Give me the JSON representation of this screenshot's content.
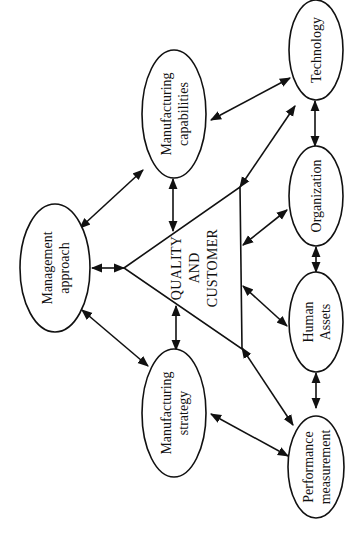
{
  "diagram": {
    "orientation": "rotated-90-ccw",
    "stroke_color": "#111111",
    "background_color": "#ffffff",
    "center": {
      "id": "quality-customer",
      "shape": "triangle",
      "lines": [
        "QUALITY",
        "AND",
        "CUSTOMER"
      ]
    },
    "nodes": [
      {
        "id": "management-approach",
        "lines": [
          "Management",
          "approach"
        ]
      },
      {
        "id": "manufacturing-capabilities",
        "lines": [
          "Manufacturing",
          "capabilities"
        ]
      },
      {
        "id": "manufacturing-strategy",
        "lines": [
          "Manufacturing",
          "strategy"
        ]
      },
      {
        "id": "technology",
        "lines": [
          "Technology"
        ]
      },
      {
        "id": "organization",
        "lines": [
          "Organization"
        ]
      },
      {
        "id": "human-assets",
        "lines": [
          "Human",
          "Assets"
        ]
      },
      {
        "id": "performance-measurement",
        "lines": [
          "Performance",
          "measurement"
        ]
      }
    ],
    "edges": [
      {
        "from": "management-approach",
        "to": "manufacturing-capabilities",
        "type": "bidirectional"
      },
      {
        "from": "management-approach",
        "to": "quality-customer",
        "type": "bidirectional"
      },
      {
        "from": "management-approach",
        "to": "manufacturing-strategy",
        "type": "bidirectional"
      },
      {
        "from": "manufacturing-capabilities",
        "to": "quality-customer",
        "type": "bidirectional"
      },
      {
        "from": "manufacturing-strategy",
        "to": "quality-customer",
        "type": "bidirectional"
      },
      {
        "from": "manufacturing-capabilities",
        "to": "technology",
        "type": "bidirectional"
      },
      {
        "from": "manufacturing-strategy",
        "to": "performance-measurement",
        "type": "bidirectional"
      },
      {
        "from": "quality-customer",
        "to": "technology",
        "type": "bidirectional"
      },
      {
        "from": "quality-customer",
        "to": "organization",
        "type": "bidirectional"
      },
      {
        "from": "quality-customer",
        "to": "human-assets",
        "type": "bidirectional"
      },
      {
        "from": "quality-customer",
        "to": "performance-measurement",
        "type": "bidirectional"
      },
      {
        "from": "technology",
        "to": "organization",
        "type": "bidirectional"
      },
      {
        "from": "organization",
        "to": "human-assets",
        "type": "bidirectional"
      },
      {
        "from": "human-assets",
        "to": "performance-measurement",
        "type": "bidirectional"
      }
    ]
  }
}
